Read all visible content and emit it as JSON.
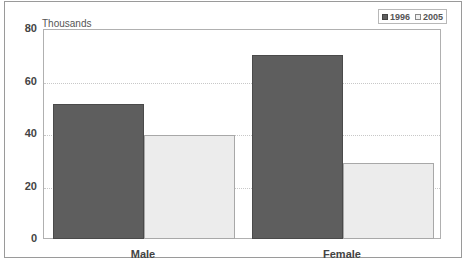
{
  "chart_data": {
    "type": "bar",
    "title": "",
    "unit_label": "Thousands",
    "xlabel": "",
    "ylabel": "Thousands",
    "categories": [
      "Male",
      "Female"
    ],
    "series": [
      {
        "name": "1996",
        "values": [
          52,
          70.5
        ],
        "color": "#5e5e5e"
      },
      {
        "name": "2005",
        "values": [
          40,
          29.5
        ],
        "color": "#ececec"
      }
    ],
    "ylim": [
      0,
      80
    ],
    "yticks": [
      0,
      20,
      40,
      60,
      80
    ],
    "grid": true,
    "legend_position": "top-right"
  }
}
